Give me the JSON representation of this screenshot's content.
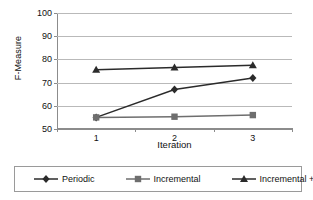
{
  "chart_data": {
    "type": "line",
    "title": "",
    "xlabel": "Iteration",
    "ylabel": "F-Measure",
    "categories": [
      "1",
      "2",
      "3"
    ],
    "x": [
      1,
      2,
      3
    ],
    "xlim": [
      0.5,
      3.5
    ],
    "ylim": [
      50,
      100
    ],
    "yticks": [
      50,
      60,
      70,
      80,
      90,
      100
    ],
    "ytick_labels": [
      "50",
      "60",
      "70",
      "80",
      "90",
      "100"
    ],
    "grid": "horizontal",
    "legend_position": "bottom",
    "series": [
      {
        "name": "Periodic",
        "marker": "diamond",
        "color": "#2b2b2b",
        "values": [
          55,
          67,
          72
        ]
      },
      {
        "name": "Incremental",
        "marker": "square",
        "color": "#6e6e6e",
        "values": [
          55,
          55.3,
          56
        ]
      },
      {
        "name": "Incremental + RI",
        "marker": "triangle",
        "color": "#2b2b2b",
        "values": [
          75.5,
          76.5,
          77.5
        ]
      }
    ]
  },
  "axes": {
    "y_title": "F-Measure",
    "x_title": "Iteration",
    "y_labels": [
      "100",
      "90",
      "80",
      "70",
      "60",
      "50"
    ],
    "x_labels": [
      "1",
      "2",
      "3"
    ]
  },
  "legend": {
    "items": [
      {
        "label": "Periodic",
        "marker": "diamond-marker-icon"
      },
      {
        "label": "Incremental",
        "marker": "square-marker-icon"
      },
      {
        "label": "Incremental + RI",
        "marker": "triangle-marker-icon"
      }
    ]
  },
  "colors": {
    "gridline": "#b9b9b9",
    "axis": "#8c8c8c",
    "series_dark": "#2b2b2b",
    "series_gray": "#6e6e6e",
    "background": "#ffffff"
  }
}
